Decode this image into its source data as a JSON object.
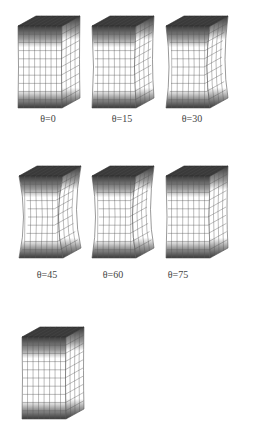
{
  "figure": {
    "symbol": "θ",
    "panels": [
      {
        "id": "p0",
        "label": "θ=0",
        "angle": 0,
        "curvature": 1,
        "x": 16,
        "y": 14,
        "labelX": 48,
        "labelY": 114,
        "bottomDark": "front"
      },
      {
        "id": "p15",
        "label": "θ=15",
        "angle": 15,
        "curvature": 3,
        "x": 90,
        "y": 14,
        "labelX": 122,
        "labelY": 114,
        "bottomDark": "front"
      },
      {
        "id": "p30",
        "label": "θ=30",
        "angle": 30,
        "curvature": 6,
        "x": 164,
        "y": 14,
        "labelX": 192,
        "labelY": 114,
        "bottomDark": "side"
      },
      {
        "id": "p45",
        "label": "θ=45",
        "angle": 45,
        "curvature": 9,
        "x": 17,
        "y": 164,
        "labelX": 47,
        "labelY": 270,
        "bottomDark": "side"
      },
      {
        "id": "p60",
        "label": "θ=60",
        "angle": 60,
        "curvature": 7,
        "x": 90,
        "y": 164,
        "labelX": 113,
        "labelY": 270,
        "bottomDark": "front"
      },
      {
        "id": "p75",
        "label": "θ=75",
        "angle": 75,
        "curvature": 2,
        "x": 164,
        "y": 164,
        "labelX": 178,
        "labelY": 270,
        "bottomDark": "front"
      },
      {
        "id": "p90",
        "label": "",
        "angle": 90,
        "curvature": 1,
        "x": 20,
        "y": 325,
        "labelX": 52,
        "labelY": 430,
        "bottomDark": "front"
      }
    ]
  },
  "colors": {
    "dark": "#3a3a3a",
    "mesh": "#555555",
    "face": "#ffffff"
  }
}
